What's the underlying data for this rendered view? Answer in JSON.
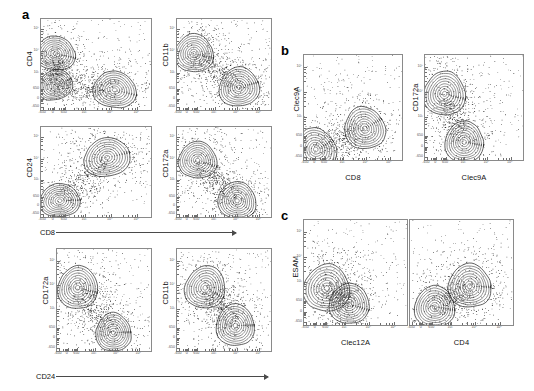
{
  "figure": {
    "type": "flow-cytometry-contour-panels",
    "width": 534,
    "height": 391,
    "background": "#ffffff",
    "axis_color": "#8a8a8a",
    "contour_color": "#4a4a4a",
    "dot_color": "#1a1a1a"
  },
  "axis_ticks": {
    "labels": [
      "-650",
      "0",
      "650",
      "10³",
      "10⁴",
      "10⁵"
    ],
    "scale": "biexponential",
    "minor_per_decade": 9
  },
  "panels": [
    {
      "id": "a",
      "letter": "a",
      "arrows": [
        {
          "label": "CD8"
        },
        {
          "label": "CD24"
        }
      ],
      "plots": [
        {
          "id": "a1",
          "ylabel": "CD4",
          "xlabel": ""
        },
        {
          "id": "a2",
          "ylabel": "CD11b",
          "xlabel": ""
        },
        {
          "id": "a3",
          "ylabel": "CD24",
          "xlabel": ""
        },
        {
          "id": "a4",
          "ylabel": "CD172a",
          "xlabel": ""
        },
        {
          "id": "a5",
          "ylabel": "CD172a",
          "xlabel": ""
        },
        {
          "id": "a6",
          "ylabel": "CD11b",
          "xlabel": ""
        }
      ]
    },
    {
      "id": "b",
      "letter": "b",
      "arrows": [],
      "plots": [
        {
          "id": "b1",
          "ylabel": "Clec9A",
          "xlabel": "CD8"
        },
        {
          "id": "b2",
          "ylabel": "CD172a",
          "xlabel": "Clec9A"
        }
      ]
    },
    {
      "id": "c",
      "letter": "c",
      "arrows": [],
      "plots": [
        {
          "id": "c1",
          "ylabel": "ESAM",
          "xlabel": "Clec12A"
        },
        {
          "id": "c2",
          "ylabel": "",
          "xlabel": "CD4"
        }
      ]
    }
  ],
  "chart_data": {
    "type": "scatter",
    "title": "",
    "xlim": [
      -650,
      270000
    ],
    "ylim": [
      -650,
      270000
    ],
    "grid": false,
    "legend": "none",
    "subplots": [
      {
        "id": "a1",
        "xlabel": "CD8",
        "ylabel": "CD4",
        "populations": [
          {
            "name": "CD4-high CD8-low",
            "x": 0.13,
            "y": 0.62,
            "weight": 0.3
          },
          {
            "name": "CD4-mid CD8-low",
            "x": 0.13,
            "y": 0.27,
            "weight": 0.18
          },
          {
            "name": "CD8-high CD4-low",
            "x": 0.67,
            "y": 0.22,
            "weight": 0.38
          }
        ]
      },
      {
        "id": "a2",
        "xlabel": "CD8",
        "ylabel": "CD11b",
        "populations": [
          {
            "name": "CD11b-high",
            "x": 0.18,
            "y": 0.62,
            "weight": 0.42
          },
          {
            "name": "CD11b-low CD8-high",
            "x": 0.66,
            "y": 0.25,
            "weight": 0.45
          }
        ]
      },
      {
        "id": "a3",
        "xlabel": "CD8",
        "ylabel": "CD24",
        "populations": [
          {
            "name": "CD24-high",
            "x": 0.6,
            "y": 0.66,
            "weight": 0.44
          },
          {
            "name": "CD24-low",
            "x": 0.17,
            "y": 0.18,
            "weight": 0.3
          }
        ]
      },
      {
        "id": "a4",
        "xlabel": "CD8",
        "ylabel": "CD172a",
        "populations": [
          {
            "name": "CD172a-high",
            "x": 0.22,
            "y": 0.63,
            "weight": 0.4
          },
          {
            "name": "CD172a-low",
            "x": 0.64,
            "y": 0.18,
            "weight": 0.4
          }
        ]
      },
      {
        "id": "a5",
        "xlabel": "CD24",
        "ylabel": "CD172a",
        "populations": [
          {
            "name": "CD172a-high CD24-low",
            "x": 0.22,
            "y": 0.62,
            "weight": 0.44
          },
          {
            "name": "CD172a-low CD24-high",
            "x": 0.6,
            "y": 0.18,
            "weight": 0.32
          }
        ]
      },
      {
        "id": "a6",
        "xlabel": "CD24",
        "ylabel": "CD11b",
        "populations": [
          {
            "name": "CD11b-high",
            "x": 0.3,
            "y": 0.62,
            "weight": 0.44
          },
          {
            "name": "CD11b-low CD24-high",
            "x": 0.62,
            "y": 0.25,
            "weight": 0.4
          }
        ]
      },
      {
        "id": "b1",
        "xlabel": "CD8",
        "ylabel": "Clec9A",
        "populations": [
          {
            "name": "Clec9A-neg",
            "x": 0.12,
            "y": 0.1,
            "weight": 0.4
          },
          {
            "name": "Clec9A-pos CD8-high",
            "x": 0.62,
            "y": 0.3,
            "weight": 0.4
          }
        ]
      },
      {
        "id": "b2",
        "xlabel": "Clec9A",
        "ylabel": "CD172a",
        "populations": [
          {
            "name": "CD172a-high Clec9A-neg",
            "x": 0.2,
            "y": 0.63,
            "weight": 0.44
          },
          {
            "name": "CD172a-low Clec9A-pos",
            "x": 0.4,
            "y": 0.17,
            "weight": 0.36
          }
        ]
      },
      {
        "id": "c1",
        "xlabel": "Clec12A",
        "ylabel": "ESAM",
        "populations": [
          {
            "name": "ESAM-mid Clec12A-low",
            "x": 0.22,
            "y": 0.35,
            "weight": 0.5
          },
          {
            "name": "ESAM-low Clec12A-mid",
            "x": 0.44,
            "y": 0.2,
            "weight": 0.34
          }
        ]
      },
      {
        "id": "c2",
        "xlabel": "CD4",
        "ylabel": "ESAM",
        "populations": [
          {
            "name": "ESAM-high CD4-pos",
            "x": 0.58,
            "y": 0.37,
            "weight": 0.42
          },
          {
            "name": "ESAM-low CD4-neg",
            "x": 0.24,
            "y": 0.17,
            "weight": 0.36
          }
        ]
      }
    ]
  }
}
